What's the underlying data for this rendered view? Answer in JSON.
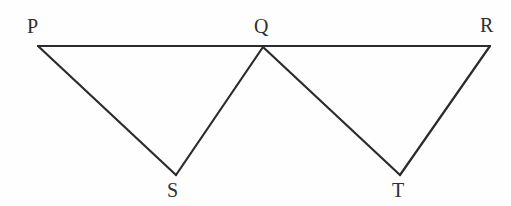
{
  "figure": {
    "background_color": "#fefefe",
    "stroke_color": "#2b2b2b",
    "label_color": "#2f2f2f",
    "stroke_width": 2.2,
    "width": 511,
    "height": 206,
    "points": {
      "P": {
        "name": "P",
        "x": 38,
        "y": 46
      },
      "Q": {
        "name": "Q",
        "x": 263,
        "y": 47
      },
      "R": {
        "name": "R",
        "x": 490,
        "y": 46
      },
      "S": {
        "name": "S",
        "x": 176,
        "y": 175
      },
      "T": {
        "name": "T",
        "x": 400,
        "y": 175
      }
    },
    "segments": [
      {
        "name": "segment-PR",
        "from": "P",
        "to": "R"
      },
      {
        "name": "segment-PS",
        "from": "P",
        "to": "S"
      },
      {
        "name": "segment-SQ",
        "from": "S",
        "to": "Q"
      },
      {
        "name": "segment-QT",
        "from": "Q",
        "to": "T"
      },
      {
        "name": "segment-TR",
        "from": "T",
        "to": "R"
      }
    ],
    "labels": [
      {
        "key": "P",
        "text": "P",
        "x": 27,
        "y": 16,
        "anchor": "above-left"
      },
      {
        "key": "Q",
        "text": "Q",
        "x": 254,
        "y": 16,
        "anchor": "above"
      },
      {
        "key": "R",
        "text": "R",
        "x": 480,
        "y": 15,
        "anchor": "above-left"
      },
      {
        "key": "S",
        "text": "S",
        "x": 167,
        "y": 180,
        "anchor": "below"
      },
      {
        "key": "T",
        "text": "T",
        "x": 392,
        "y": 180,
        "anchor": "below"
      }
    ]
  }
}
